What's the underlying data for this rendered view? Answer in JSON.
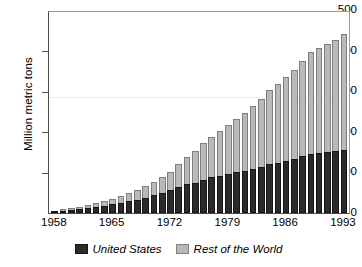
{
  "chart_data": {
    "type": "bar",
    "title": "",
    "subtitle": "",
    "xlabel": "",
    "ylabel": "Million metric tons",
    "stacked": true,
    "grid": false,
    "legend_position": "bottom-center",
    "ylim": [
      0,
      500
    ],
    "yticks": [
      0,
      100,
      200,
      300,
      400,
      500
    ],
    "ytick_labels": [
      "0",
      "100",
      "200",
      "300",
      "400",
      "500"
    ],
    "xlim": [
      1958,
      1993
    ],
    "xticks": [
      1958,
      1965,
      1972,
      1979,
      1986,
      1993
    ],
    "xtick_labels": [
      "1958",
      "1965",
      "1972",
      "1979",
      "1986",
      "1993"
    ],
    "categories": [
      "1958",
      "1959",
      "1960",
      "1961",
      "1962",
      "1963",
      "1964",
      "1965",
      "1966",
      "1967",
      "1968",
      "1969",
      "1970",
      "1971",
      "1972",
      "1973",
      "1974",
      "1975",
      "1976",
      "1977",
      "1978",
      "1979",
      "1980",
      "1981",
      "1982",
      "1983",
      "1984",
      "1985",
      "1986",
      "1987",
      "1988",
      "1989",
      "1990",
      "1991",
      "1992",
      "1993"
    ],
    "series": [
      {
        "name": "United States",
        "color": "#2b2b2b",
        "values": [
          4,
          6,
          8,
          10,
          12,
          15,
          18,
          21,
          25,
          29,
          33,
          38,
          44,
          50,
          57,
          65,
          72,
          75,
          82,
          88,
          92,
          97,
          101,
          104,
          108,
          113,
          120,
          124,
          128,
          133,
          140,
          146,
          149,
          151,
          152,
          156
        ]
      },
      {
        "name": "Rest of the World",
        "color": "#b9b9b9",
        "values": [
          2,
          3,
          4,
          6,
          8,
          10,
          12,
          14,
          17,
          20,
          23,
          28,
          33,
          39,
          45,
          55,
          66,
          78,
          90,
          100,
          110,
          120,
          130,
          143,
          155,
          168,
          183,
          194,
          206,
          220,
          235,
          250,
          258,
          265,
          274,
          286
        ]
      }
    ],
    "totals": [
      6,
      9,
      12,
      16,
      20,
      25,
      30,
      35,
      42,
      49,
      56,
      66,
      77,
      89,
      102,
      120,
      138,
      153,
      172,
      188,
      202,
      217,
      231,
      247,
      263,
      281,
      303,
      318,
      334,
      353,
      375,
      396,
      407,
      416,
      426,
      442
    ],
    "colors": {
      "united_states": "#2b2b2b",
      "rest_of_world": "#b9b9b9",
      "axis": "#4f4f4f",
      "background": "#ffffff"
    },
    "legend": [
      {
        "label": "United States",
        "swatch": "#2b2b2b"
      },
      {
        "label": "Rest of the World",
        "swatch": "#b9b9b9"
      }
    ]
  }
}
